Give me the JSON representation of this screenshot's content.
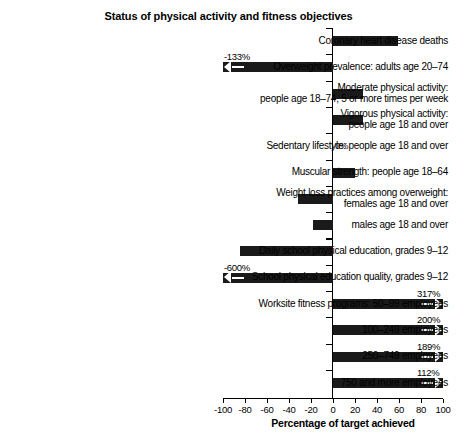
{
  "chart_data": {
    "type": "bar",
    "orientation": "horizontal",
    "title": "Status of physical activity and fitness objectives",
    "xlabel": "Percentage of target achieved",
    "ylabel": "",
    "xlim": [
      -100,
      100
    ],
    "xticks": [
      -100,
      -80,
      -60,
      -40,
      -20,
      0,
      20,
      40,
      60,
      80,
      100
    ],
    "xtick_labels": [
      "-100",
      "-80",
      "-60",
      "-40",
      "-20",
      "0",
      "20",
      "40",
      "60",
      "80",
      "100"
    ],
    "grid": false,
    "legend": null,
    "categories": [
      "Coronary heart disease deaths",
      "Overweight prevalence: adults age 20–74",
      "Moderate physical activity:\npeople age 18–74, 5 or more times per week",
      "Vigorous physical activity:\npeople age 18 and over",
      "Sedentary lifestyle: people age 18 and over",
      "Muscular strength: people age 18–64",
      "Weight loss practices among overweight:\nfemales age 18 and over",
      "males age 18 and over",
      "Daily school physical education, grades 9–12",
      "School physical education quality, grades 9–12",
      "Worksite fitness programs: 50–99 employees",
      "100–249 employees",
      "250–749 employees",
      "750 and more employees"
    ],
    "values": [
      59,
      -133,
      27,
      27,
      0,
      20,
      -32,
      -18,
      -85,
      -600,
      317,
      200,
      189,
      112
    ],
    "annotations": [
      {
        "category": "Overweight prevalence: adults age 20–74",
        "text": "-133%",
        "clipped": true
      },
      {
        "category": "Sedentary lifestyle: people age 18 and over",
        "text": "0%",
        "clipped": false
      },
      {
        "category": "School physical education quality, grades 9–12",
        "text": "-600%",
        "clipped": true
      },
      {
        "category": "Worksite fitness programs: 50–99 employees",
        "text": "317%",
        "clipped": true
      },
      {
        "category": "100–249 employees",
        "text": "200%",
        "clipped": true
      },
      {
        "category": "250–749 employees",
        "text": "189%",
        "clipped": true
      },
      {
        "category": "750 and more employees",
        "text": "112%",
        "clipped": true
      }
    ],
    "bar_color": "#1a1a1a"
  },
  "rows": [
    {
      "label": "Coronary heart disease deaths",
      "value": 59,
      "value_label": ""
    },
    {
      "label": "Overweight prevalence: adults age 20–74",
      "value": -133,
      "value_label": "-133%"
    },
    {
      "label": "Moderate physical activity:\npeople age 18–74, 5 or more times per week",
      "value": 27,
      "value_label": ""
    },
    {
      "label": "Vigorous physical activity:\npeople age 18 and over",
      "value": 27,
      "value_label": ""
    },
    {
      "label": "Sedentary lifestyle: people age 18 and over",
      "value": 0,
      "value_label": "0%"
    },
    {
      "label": "Muscular strength: people age 18–64",
      "value": 20,
      "value_label": ""
    },
    {
      "label": "Weight loss practices among overweight:\nfemales age 18 and over",
      "value": -32,
      "value_label": ""
    },
    {
      "label": "males age 18 and over",
      "value": -18,
      "value_label": ""
    },
    {
      "label": "Daily school physical education, grades 9–12",
      "value": -85,
      "value_label": ""
    },
    {
      "label": "School physical education quality, grades 9–12",
      "value": -600,
      "value_label": "-600%"
    },
    {
      "label": "Worksite fitness programs: 50–99 employees",
      "value": 317,
      "value_label": "317%"
    },
    {
      "label": "100–249 employees",
      "value": 200,
      "value_label": "200%"
    },
    {
      "label": "250–749 employees",
      "value": 189,
      "value_label": "189%"
    },
    {
      "label": "750 and more employees",
      "value": 112,
      "value_label": "112%"
    }
  ],
  "xticks": [
    {
      "label": "-100"
    },
    {
      "label": "-80"
    },
    {
      "label": "-60"
    },
    {
      "label": "-40"
    },
    {
      "label": "-20"
    },
    {
      "label": "0"
    },
    {
      "label": "20"
    },
    {
      "label": "40"
    },
    {
      "label": "60"
    },
    {
      "label": "80"
    },
    {
      "label": "100"
    }
  ]
}
